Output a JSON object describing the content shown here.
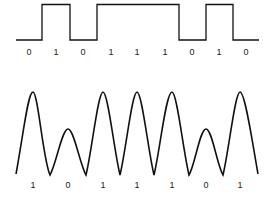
{
  "digital_signal": {
    "bits": [
      "0",
      "1",
      "0",
      "1",
      "1",
      "1",
      "0",
      "1",
      "0"
    ],
    "label_x": [
      29,
      56,
      83,
      111,
      137,
      165,
      192,
      219,
      246
    ],
    "label_y": 55,
    "low_y": 40,
    "high_y": 4.5,
    "start_x": 16,
    "transitions_x": [
      42,
      70,
      97,
      179,
      206,
      233
    ],
    "end_x": 259
  },
  "analog_signal": {
    "bits": [
      "1",
      "0",
      "1",
      "1",
      "1",
      "0",
      "1"
    ],
    "label_x": [
      33,
      68,
      103,
      137,
      172,
      206,
      240
    ],
    "label_y": 188,
    "baseline_y": 174,
    "tall_peak_y": 92,
    "short_peak_y": 129,
    "start_x": 16,
    "end_x": 258
  },
  "colors": {
    "line": "#111111",
    "label": "#222222",
    "background": "#ffffff"
  }
}
